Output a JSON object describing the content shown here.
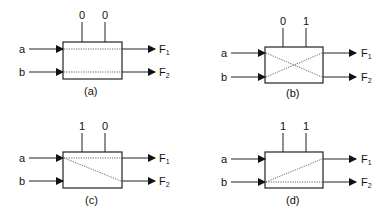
{
  "panels": [
    {
      "id": "a",
      "caption": "(a)",
      "controls": [
        "0",
        "0"
      ],
      "inputs": [
        "a",
        "b"
      ],
      "outputs": [
        {
          "main": "F",
          "sub": "1"
        },
        {
          "main": "F",
          "sub": "2"
        }
      ],
      "routing": "straight: a→F1, b→F2"
    },
    {
      "id": "b",
      "caption": "(b)",
      "controls": [
        "0",
        "1"
      ],
      "inputs": [
        "a",
        "b"
      ],
      "outputs": [
        {
          "main": "F",
          "sub": "1"
        },
        {
          "main": "F",
          "sub": "2"
        }
      ],
      "routing": "cross: a→F2, b→F1"
    },
    {
      "id": "c",
      "caption": "(c)",
      "controls": [
        "1",
        "0"
      ],
      "inputs": [
        "a",
        "b"
      ],
      "outputs": [
        {
          "main": "F",
          "sub": "1"
        },
        {
          "main": "F",
          "sub": "2"
        }
      ],
      "routing": "broadcast a: a→F1, a→F2"
    },
    {
      "id": "d",
      "caption": "(d)",
      "controls": [
        "1",
        "1"
      ],
      "inputs": [
        "a",
        "b"
      ],
      "outputs": [
        {
          "main": "F",
          "sub": "1"
        },
        {
          "main": "F",
          "sub": "2"
        }
      ],
      "routing": "broadcast b: b→F1, b→F2"
    }
  ]
}
